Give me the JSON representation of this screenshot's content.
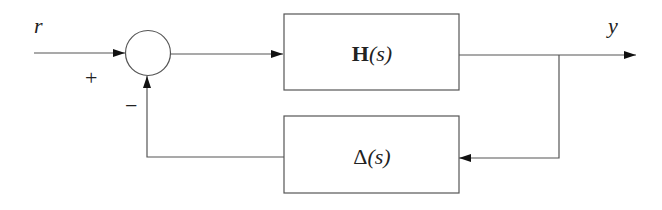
{
  "diagram": {
    "type": "feedback-loop-block-diagram",
    "input_signal": {
      "label": "r"
    },
    "output_signal": {
      "label": "y"
    },
    "summing_junction": {
      "signs": {
        "input": "+",
        "feedback": "−"
      }
    },
    "blocks": {
      "forward": {
        "label_main": "H",
        "label_arg": "(s)"
      },
      "feedback": {
        "label_main": "Δ",
        "label_arg": "(s)"
      }
    },
    "colors": {
      "stroke": "#555555",
      "text": "#222222",
      "background": "#ffffff"
    }
  }
}
